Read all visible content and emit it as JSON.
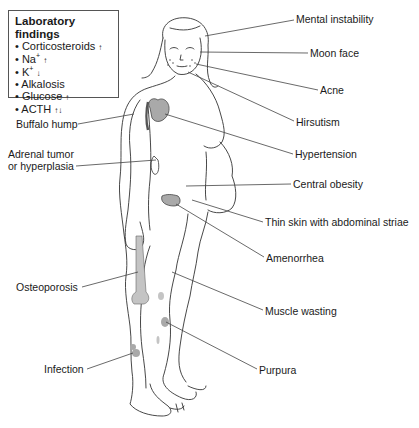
{
  "lab_box": {
    "title": "Laboratory findings",
    "items": [
      {
        "bullet": "•",
        "name": "Corticosteroids",
        "sup": "",
        "arrow": "↑"
      },
      {
        "bullet": "•",
        "name": "Na",
        "sup": "+",
        "arrow": "↑"
      },
      {
        "bullet": "•",
        "name": "K",
        "sup": "+",
        "arrow": "↓"
      },
      {
        "bullet": "•",
        "name": "Alkalosis",
        "sup": "",
        "arrow": ""
      },
      {
        "bullet": "•",
        "name": "Glucose",
        "sup": "",
        "arrow": "↑"
      },
      {
        "bullet": "•",
        "name": "ACTH",
        "sup": "",
        "arrow": "↑↓"
      }
    ]
  },
  "labels": {
    "mental_instability": "Mental instability",
    "moon_face": "Moon face",
    "acne": "Acne",
    "hirsutism": "Hirsutism",
    "hypertension": "Hypertension",
    "central_obesity": "Central obesity",
    "thin_skin": "Thin skin with abdominal striae",
    "amenorrhea": "Amenorrhea",
    "muscle_wasting": "Muscle wasting",
    "purpura": "Purpura",
    "buffalo_hump": "Buffalo hump",
    "adrenal_line1": "Adrenal tumor",
    "adrenal_line2": "or hyperplasia",
    "osteoporosis": "Osteoporosis",
    "infection": "Infection"
  },
  "colors": {
    "outline": "#333333",
    "leader": "#444444",
    "fill_gray": "#a9a9a9",
    "fill_light": "#c4c4c4"
  }
}
